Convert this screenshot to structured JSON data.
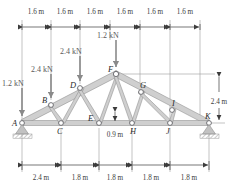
{
  "figure": {
    "type": "truss-diagram",
    "background": "#ffffff",
    "member_fill": "#cfcfcf",
    "member_stroke": "#8d8d8d",
    "node_stroke": "#55555a",
    "dimension_color": "#3c3c3c",
    "load_color": "#8a8a8a",
    "support_color": "#b4b4b4"
  },
  "top_dimensions": {
    "labels": [
      "1.6 m",
      "1.6 m",
      "1.6 m",
      "1.6 m",
      "1.6 m",
      "1.6 m"
    ]
  },
  "bottom_dimensions": {
    "labels": [
      "2.4 m",
      "1.8 m",
      "1.8 m",
      "1.8 m",
      "1.8 m"
    ]
  },
  "vertical_dimensions": {
    "right_label": "2.4 m",
    "mid_label": "0.9 m"
  },
  "loads": [
    {
      "id": "load-a",
      "label": "1.2 kN",
      "at_node": "A"
    },
    {
      "id": "load-b",
      "label": "2.4 kN",
      "at_node": "B"
    },
    {
      "id": "load-d",
      "label": "2.4 kN",
      "at_node": "D"
    },
    {
      "id": "load-f",
      "label": "1.2 kN",
      "at_node": "F"
    }
  ],
  "nodes": [
    {
      "id": "A",
      "label": "A",
      "x": 22,
      "y": 123
    },
    {
      "id": "B",
      "label": "B",
      "x": 51,
      "y": 105
    },
    {
      "id": "C",
      "label": "C",
      "x": 61,
      "y": 123
    },
    {
      "id": "D",
      "label": "D",
      "x": 80,
      "y": 88
    },
    {
      "id": "E",
      "label": "E",
      "x": 99,
      "y": 123
    },
    {
      "id": "F",
      "label": "F",
      "x": 116,
      "y": 74
    },
    {
      "id": "G",
      "label": "G",
      "x": 141,
      "y": 92
    },
    {
      "id": "H",
      "label": "H",
      "x": 132,
      "y": 123
    },
    {
      "id": "I",
      "label": "I",
      "x": 172,
      "y": 110
    },
    {
      "id": "J",
      "label": "J",
      "x": 170,
      "y": 123
    },
    {
      "id": "K",
      "label": "K",
      "x": 209,
      "y": 123
    }
  ],
  "supports": [
    {
      "id": "support-a",
      "type": "pin",
      "at_node": "A"
    },
    {
      "id": "support-k",
      "type": "roller",
      "at_node": "K"
    }
  ]
}
